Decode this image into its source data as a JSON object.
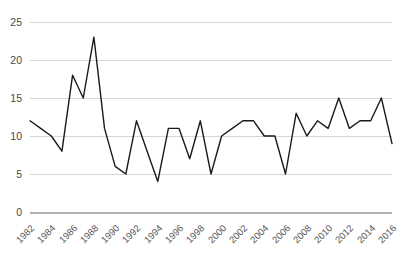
{
  "chart_data": {
    "type": "line",
    "title": "",
    "subtitle": "",
    "xlabel": "",
    "ylabel": "",
    "x": [
      1982,
      1983,
      1984,
      1985,
      1986,
      1987,
      1988,
      1989,
      1990,
      1991,
      1992,
      1993,
      1994,
      1995,
      1996,
      1997,
      1998,
      1999,
      2000,
      2001,
      2002,
      2003,
      2004,
      2005,
      2006,
      2007,
      2008,
      2009,
      2010,
      2011,
      2012,
      2013,
      2014,
      2015,
      2016
    ],
    "values": [
      12,
      11,
      10,
      8,
      18,
      15,
      23,
      11,
      6,
      5,
      12,
      8,
      4,
      11,
      11,
      7,
      12,
      5,
      10,
      11,
      12,
      12,
      10,
      10,
      5,
      13,
      10,
      12,
      11,
      15,
      11,
      12,
      12,
      15,
      9
    ],
    "series": [
      {
        "name": "series-1",
        "values": [
          12,
          11,
          10,
          8,
          18,
          15,
          23,
          11,
          6,
          5,
          12,
          8,
          4,
          11,
          11,
          7,
          12,
          5,
          10,
          11,
          12,
          12,
          10,
          10,
          5,
          13,
          10,
          12,
          11,
          15,
          11,
          12,
          12,
          15,
          9
        ]
      }
    ],
    "xlim": [
      1982,
      2016
    ],
    "ylim": [
      0,
      25
    ],
    "yticks": [
      0,
      5,
      10,
      15,
      20,
      25
    ],
    "ytick_labels": [
      "0",
      "5",
      "10",
      "15",
      "20",
      "25"
    ],
    "xtick_years": [
      1982,
      1984,
      1986,
      1988,
      1990,
      1992,
      1994,
      1996,
      1998,
      2000,
      2002,
      2004,
      2006,
      2008,
      2010,
      2012,
      2014,
      2016
    ],
    "xtick_labels": [
      "1982",
      "1984",
      "1986",
      "1988",
      "1990",
      "1992",
      "1994",
      "1996",
      "1998",
      "2000",
      "2002",
      "2004",
      "2006",
      "2008",
      "2010",
      "2012",
      "2014",
      "2016"
    ],
    "grid": "horizontal",
    "legend": "none",
    "colors": {
      "line": "#1a1a1a",
      "grid": "#d6d6d6",
      "axis": "#b0b0b0",
      "tick_text": "#4a4a4a",
      "xtick_text": "#555555",
      "background": "#ffffff"
    },
    "annotations": []
  }
}
